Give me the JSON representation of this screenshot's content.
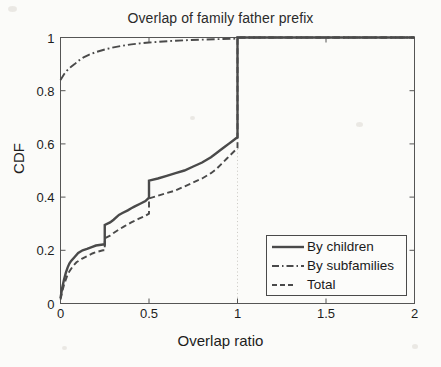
{
  "figure": {
    "background_color": "#fbfbf9",
    "axes_color": "#555555",
    "line_color": "#4a4a4a"
  },
  "chart_data": {
    "type": "line",
    "title": "Overlap of family father prefix",
    "xlabel": "Overlap ratio",
    "ylabel": "CDF",
    "xlim": [
      0,
      2
    ],
    "ylim": [
      0,
      1
    ],
    "xticks": [
      0,
      0.5,
      1,
      1.5,
      2
    ],
    "xticklabels": [
      "0",
      "0.5",
      "1",
      "1.5",
      "2"
    ],
    "yticks": [
      0,
      0.2,
      0.4,
      0.6,
      0.8,
      1
    ],
    "yticklabels": [
      "0",
      "0.2",
      "0.4",
      "0.6",
      "0.8",
      "1"
    ],
    "grid": "dotted vertical gridline at x=1",
    "legend_position": "lower right",
    "series": [
      {
        "name": "By children",
        "style": "solid",
        "points": [
          [
            0.0,
            0.02
          ],
          [
            0.01,
            0.06
          ],
          [
            0.02,
            0.09
          ],
          [
            0.03,
            0.115
          ],
          [
            0.04,
            0.135
          ],
          [
            0.05,
            0.15
          ],
          [
            0.06,
            0.16
          ],
          [
            0.08,
            0.175
          ],
          [
            0.1,
            0.19
          ],
          [
            0.125,
            0.2
          ],
          [
            0.15,
            0.205
          ],
          [
            0.18,
            0.213
          ],
          [
            0.2,
            0.218
          ],
          [
            0.24,
            0.222
          ],
          [
            0.25,
            0.222
          ],
          [
            0.25,
            0.295
          ],
          [
            0.28,
            0.305
          ],
          [
            0.3,
            0.315
          ],
          [
            0.33,
            0.333
          ],
          [
            0.35,
            0.34
          ],
          [
            0.38,
            0.35
          ],
          [
            0.4,
            0.358
          ],
          [
            0.42,
            0.365
          ],
          [
            0.45,
            0.375
          ],
          [
            0.48,
            0.385
          ],
          [
            0.5,
            0.398
          ],
          [
            0.5,
            0.462
          ],
          [
            0.55,
            0.47
          ],
          [
            0.6,
            0.48
          ],
          [
            0.65,
            0.49
          ],
          [
            0.7,
            0.5
          ],
          [
            0.75,
            0.515
          ],
          [
            0.8,
            0.53
          ],
          [
            0.85,
            0.55
          ],
          [
            0.88,
            0.565
          ],
          [
            0.9,
            0.575
          ],
          [
            0.93,
            0.59
          ],
          [
            0.95,
            0.6
          ],
          [
            0.97,
            0.61
          ],
          [
            0.99,
            0.62
          ],
          [
            1.0,
            0.625
          ],
          [
            1.0,
            1.0
          ],
          [
            2.0,
            1.0
          ]
        ]
      },
      {
        "name": "By subfamilies",
        "style": "dash-dot",
        "points": [
          [
            0.0,
            0.84
          ],
          [
            0.02,
            0.862
          ],
          [
            0.04,
            0.878
          ],
          [
            0.06,
            0.89
          ],
          [
            0.08,
            0.9
          ],
          [
            0.1,
            0.912
          ],
          [
            0.13,
            0.925
          ],
          [
            0.16,
            0.935
          ],
          [
            0.2,
            0.945
          ],
          [
            0.25,
            0.955
          ],
          [
            0.3,
            0.963
          ],
          [
            0.35,
            0.969
          ],
          [
            0.4,
            0.974
          ],
          [
            0.45,
            0.978
          ],
          [
            0.5,
            0.981
          ],
          [
            0.58,
            0.985
          ],
          [
            0.65,
            0.988
          ],
          [
            0.72,
            0.99
          ],
          [
            0.8,
            0.992
          ],
          [
            0.9,
            0.994
          ],
          [
            1.0,
            0.996
          ],
          [
            1.0,
            1.0
          ],
          [
            2.0,
            1.0
          ]
        ]
      },
      {
        "name": "Total",
        "style": "dashed",
        "points": [
          [
            0.0,
            0.015
          ],
          [
            0.01,
            0.045
          ],
          [
            0.02,
            0.07
          ],
          [
            0.03,
            0.09
          ],
          [
            0.04,
            0.108
          ],
          [
            0.05,
            0.12
          ],
          [
            0.07,
            0.14
          ],
          [
            0.09,
            0.155
          ],
          [
            0.12,
            0.168
          ],
          [
            0.15,
            0.178
          ],
          [
            0.18,
            0.188
          ],
          [
            0.2,
            0.193
          ],
          [
            0.24,
            0.2
          ],
          [
            0.25,
            0.2
          ],
          [
            0.25,
            0.245
          ],
          [
            0.28,
            0.255
          ],
          [
            0.3,
            0.265
          ],
          [
            0.33,
            0.278
          ],
          [
            0.36,
            0.29
          ],
          [
            0.4,
            0.305
          ],
          [
            0.44,
            0.318
          ],
          [
            0.48,
            0.33
          ],
          [
            0.5,
            0.338
          ],
          [
            0.5,
            0.395
          ],
          [
            0.55,
            0.405
          ],
          [
            0.6,
            0.415
          ],
          [
            0.65,
            0.425
          ],
          [
            0.7,
            0.44
          ],
          [
            0.75,
            0.455
          ],
          [
            0.8,
            0.47
          ],
          [
            0.85,
            0.49
          ],
          [
            0.88,
            0.505
          ],
          [
            0.91,
            0.525
          ],
          [
            0.94,
            0.545
          ],
          [
            0.97,
            0.565
          ],
          [
            0.99,
            0.578
          ],
          [
            1.0,
            0.585
          ],
          [
            1.0,
            1.0
          ],
          [
            2.0,
            1.0
          ]
        ]
      }
    ]
  }
}
